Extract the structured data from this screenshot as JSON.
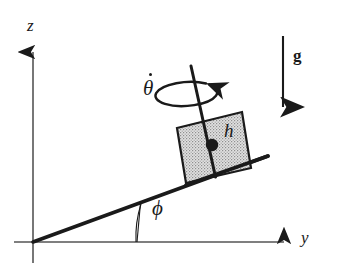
{
  "figure": {
    "name": "block-on-incline-diagram",
    "background_color": "#ffffff",
    "stroke_color": "#1a1a1a",
    "axis_color": "#555555",
    "block_fill_color": "#d4d4d4",
    "block_edge_color": "#1a1a1a"
  },
  "axes": {
    "vertical": {
      "label": "z",
      "orientation": "up",
      "origin": {
        "x": 33,
        "y": 242
      },
      "tip": {
        "x": 33,
        "y": 46
      },
      "label_position": {
        "x": 27,
        "y": 18
      }
    },
    "horizontal": {
      "label": "y",
      "orientation": "right",
      "origin": {
        "x": 14,
        "y": 242
      },
      "tip": {
        "x": 290,
        "y": 242
      },
      "label_position": {
        "x": 302,
        "y": 230
      }
    }
  },
  "incline": {
    "name": "inclined-plane",
    "start": {
      "x": 33,
      "y": 242
    },
    "end": {
      "x": 268,
      "y": 156
    },
    "angle_label": "ϕ",
    "angle_label_position": {
      "x": 152,
      "y": 202
    },
    "angle_arc_from": {
      "x": 135,
      "y": 242
    },
    "angle_arc_to": {
      "x": 140,
      "y": 203
    },
    "angle_vertical_tick_top": {
      "x": 140,
      "y": 204
    },
    "angle_vertical_tick_bottom": {
      "x": 137,
      "y": 242
    }
  },
  "block": {
    "name": "sliding-block",
    "corners": [
      {
        "x": 177,
        "y": 128
      },
      {
        "x": 242,
        "y": 112
      },
      {
        "x": 251,
        "y": 168
      },
      {
        "x": 186,
        "y": 183
      }
    ],
    "center_of_mass": {
      "x": 212,
      "y": 145
    },
    "height_label": "h",
    "height_label_position": {
      "x": 224,
      "y": 124
    }
  },
  "spin": {
    "name": "spin-axis-and-rotation",
    "axis_top": {
      "x": 191,
      "y": 66
    },
    "axis_bottom": {
      "x": 215,
      "y": 176
    },
    "rate_label": "θ",
    "rate_label_has_dot": true,
    "rate_label_position": {
      "x": 143,
      "y": 78
    },
    "ellipse_center": {
      "x": 198,
      "y": 94
    },
    "ellipse_rx": 31,
    "ellipse_ry": 12,
    "arrow_direction": "counterclockwise-viewed-from-above"
  },
  "gravity": {
    "name": "gravity-vector",
    "label": "g",
    "label_bold": true,
    "label_position": {
      "x": 294,
      "y": 58
    },
    "arrow_start": {
      "x": 283,
      "y": 36
    },
    "arrow_end": {
      "x": 283,
      "y": 114
    }
  }
}
